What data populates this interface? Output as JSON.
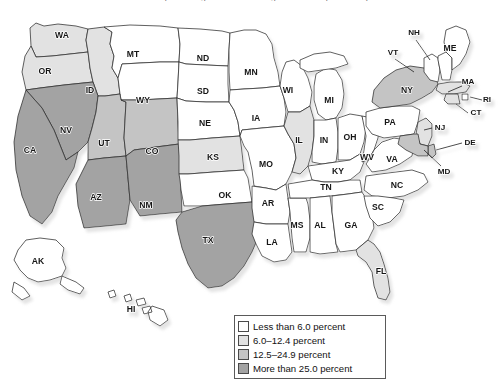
{
  "figure": {
    "clipped_title": "Persons of Hispanic Origin as a Percentage of Total Population by State",
    "map_type": "choropleth-us-states"
  },
  "legend": {
    "name": "map-legend",
    "items": [
      {
        "label": "Less than 6.0 percent",
        "color": "#ffffff",
        "range": [
          0,
          6.0
        ]
      },
      {
        "label": "6.0–12.4 percent",
        "color": "#e2e2e2",
        "range": [
          6.0,
          12.4
        ]
      },
      {
        "label": "12.5–24.9 percent",
        "color": "#c4c4c4",
        "range": [
          12.5,
          24.9
        ]
      },
      {
        "label": "More than 25.0 percent",
        "color": "#a3a3a3",
        "range": [
          25.0,
          100
        ]
      }
    ]
  },
  "chart_data": {
    "type": "map",
    "title": "Persons of Hispanic Origin as a Percentage of Total Population by State",
    "categories": [
      "Less than 6.0 percent",
      "6.0–12.4 percent",
      "12.5–24.9 percent",
      "More than 25.0 percent"
    ],
    "colors": [
      "#ffffff",
      "#e2e2e2",
      "#c4c4c4",
      "#a3a3a3"
    ],
    "states": [
      {
        "code": "WA",
        "label": "WA",
        "class": 2,
        "x": 62,
        "y": 36
      },
      {
        "code": "OR",
        "label": "OR",
        "class": 2,
        "x": 45,
        "y": 72
      },
      {
        "code": "CA",
        "label": "CA",
        "class": 4,
        "x": 30,
        "y": 151
      },
      {
        "code": "NV",
        "label": "NV",
        "class": 4,
        "x": 66,
        "y": 131
      },
      {
        "code": "ID",
        "label": "ID",
        "class": 2,
        "x": 90,
        "y": 91
      },
      {
        "code": "MT",
        "label": "MT",
        "class": 1,
        "x": 133,
        "y": 55
      },
      {
        "code": "WY",
        "label": "WY",
        "class": 1,
        "x": 143,
        "y": 101
      },
      {
        "code": "UT",
        "label": "UT",
        "class": 3,
        "x": 104,
        "y": 144
      },
      {
        "code": "AZ",
        "label": "AZ",
        "class": 4,
        "x": 96,
        "y": 198
      },
      {
        "code": "CO",
        "label": "CO",
        "class": 3,
        "x": 152,
        "y": 152
      },
      {
        "code": "NM",
        "label": "NM",
        "class": 4,
        "x": 146,
        "y": 206
      },
      {
        "code": "ND",
        "label": "ND",
        "class": 1,
        "x": 203,
        "y": 59
      },
      {
        "code": "SD",
        "label": "SD",
        "class": 1,
        "x": 203,
        "y": 92
      },
      {
        "code": "NE",
        "label": "NE",
        "class": 1,
        "x": 205,
        "y": 124
      },
      {
        "code": "KS",
        "label": "KS",
        "class": 2,
        "x": 213,
        "y": 158
      },
      {
        "code": "OK",
        "label": "OK",
        "class": 1,
        "x": 225,
        "y": 196
      },
      {
        "code": "TX",
        "label": "TX",
        "class": 4,
        "x": 208,
        "y": 241
      },
      {
        "code": "MN",
        "label": "MN",
        "class": 1,
        "x": 251,
        "y": 73
      },
      {
        "code": "IA",
        "label": "IA",
        "class": 1,
        "x": 256,
        "y": 119
      },
      {
        "code": "MO",
        "label": "MO",
        "class": 1,
        "x": 266,
        "y": 165
      },
      {
        "code": "AR",
        "label": "AR",
        "class": 1,
        "x": 268,
        "y": 204
      },
      {
        "code": "LA",
        "label": "LA",
        "class": 1,
        "x": 272,
        "y": 243
      },
      {
        "code": "WI",
        "label": "WI",
        "class": 1,
        "x": 288,
        "y": 91
      },
      {
        "code": "IL",
        "label": "IL",
        "class": 2,
        "x": 299,
        "y": 141
      },
      {
        "code": "MS",
        "label": "MS",
        "class": 1,
        "x": 297,
        "y": 226
      },
      {
        "code": "MI",
        "label": "MI",
        "class": 1,
        "x": 329,
        "y": 101
      },
      {
        "code": "IN",
        "label": "IN",
        "class": 1,
        "x": 324,
        "y": 141
      },
      {
        "code": "KY",
        "label": "KY",
        "class": 1,
        "x": 338,
        "y": 172
      },
      {
        "code": "TN",
        "label": "TN",
        "class": 1,
        "x": 326,
        "y": 188
      },
      {
        "code": "AL",
        "label": "AL",
        "class": 1,
        "x": 320,
        "y": 226
      },
      {
        "code": "OH",
        "label": "OH",
        "class": 1,
        "x": 350,
        "y": 138
      },
      {
        "code": "GA",
        "label": "GA",
        "class": 1,
        "x": 351,
        "y": 226
      },
      {
        "code": "WV",
        "label": "WV",
        "class": 1,
        "x": 367,
        "y": 158
      },
      {
        "code": "VA",
        "label": "VA",
        "class": 1,
        "x": 392,
        "y": 160
      },
      {
        "code": "SC",
        "label": "SC",
        "class": 1,
        "x": 378,
        "y": 208
      },
      {
        "code": "NC",
        "label": "NC",
        "class": 1,
        "x": 397,
        "y": 186
      },
      {
        "code": "FL",
        "label": "FL",
        "class": 2,
        "x": 381,
        "y": 272
      },
      {
        "code": "PA",
        "label": "PA",
        "class": 1,
        "x": 390,
        "y": 123
      },
      {
        "code": "NY",
        "label": "NY",
        "class": 3,
        "x": 407,
        "y": 91
      },
      {
        "code": "VT",
        "label": "VT",
        "class": 1,
        "x": 393,
        "y": 53
      },
      {
        "code": "NH",
        "label": "NH",
        "class": 1,
        "x": 414,
        "y": 33
      },
      {
        "code": "ME",
        "label": "ME",
        "class": 1,
        "x": 450,
        "y": 49
      },
      {
        "code": "MA",
        "label": "MA",
        "class": 2,
        "x": 468,
        "y": 82
      },
      {
        "code": "RI",
        "label": "RI",
        "class": 1,
        "x": 487,
        "y": 100
      },
      {
        "code": "CT",
        "label": "CT",
        "class": 2,
        "x": 476,
        "y": 113
      },
      {
        "code": "NJ",
        "label": "NJ",
        "class": 2,
        "x": 440,
        "y": 128
      },
      {
        "code": "DE",
        "label": "DE",
        "class": 3,
        "x": 470,
        "y": 143
      },
      {
        "code": "MD",
        "label": "MD",
        "class": 3,
        "x": 444,
        "y": 172
      },
      {
        "code": "AK",
        "label": "AK",
        "class": 1,
        "x": 38,
        "y": 262
      },
      {
        "code": "HI",
        "label": "HI",
        "class": 1,
        "x": 131,
        "y": 310
      }
    ]
  }
}
